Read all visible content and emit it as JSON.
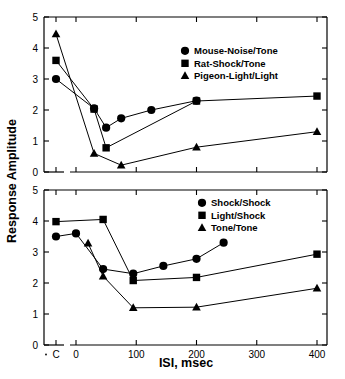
{
  "figure": {
    "axis_titles": {
      "y": "Response Amplitude",
      "x": "ISI, msec"
    }
  },
  "chart_data": [
    {
      "type": "line",
      "panel": "top",
      "title": "",
      "xlabel": "ISI, msec",
      "ylabel": "Response Amplitude",
      "xlim": [
        -1,
        430
      ],
      "ylim": [
        0,
        5
      ],
      "x_break": true,
      "xticks": [
        "C",
        "0",
        "100",
        "200",
        "300",
        "400"
      ],
      "xtick_values": [
        -1,
        0,
        100,
        200,
        300,
        400
      ],
      "yticks": [
        "0",
        "1",
        "2",
        "3",
        "4",
        "5"
      ],
      "ytick_values": [
        0,
        1,
        2,
        3,
        4,
        5
      ],
      "grid": false,
      "legend_position": "upper right",
      "series": [
        {
          "name": "Mouse-Noise/Tone",
          "marker": "circle",
          "x": [
            -1,
            30,
            50,
            75,
            125,
            200
          ],
          "y": [
            3.0,
            2.05,
            1.43,
            1.73,
            2.0,
            2.3
          ]
        },
        {
          "name": "Rat-Shock/Tone",
          "marker": "square",
          "x": [
            -1,
            30,
            50,
            200,
            400
          ],
          "y": [
            3.6,
            2.03,
            0.78,
            2.29,
            2.45
          ]
        },
        {
          "name": "Pigeon-Light/Light",
          "marker": "triangle",
          "x": [
            -1,
            30,
            75,
            200,
            400
          ],
          "y": [
            4.45,
            0.6,
            0.22,
            0.8,
            1.3
          ]
        }
      ]
    },
    {
      "type": "line",
      "panel": "bottom",
      "title": "",
      "xlabel": "ISI, msec",
      "ylabel": "Response Amplitude",
      "xlim": [
        -1,
        430
      ],
      "ylim": [
        0,
        5
      ],
      "x_break": true,
      "xticks": [
        "C",
        "0",
        "100",
        "200",
        "300",
        "400"
      ],
      "xtick_values": [
        -1,
        0,
        100,
        200,
        300,
        400
      ],
      "yticks": [
        "0",
        "1",
        "2",
        "3",
        "4",
        "5"
      ],
      "ytick_values": [
        0,
        1,
        2,
        3,
        4,
        5
      ],
      "grid": false,
      "legend_position": "upper right",
      "series": [
        {
          "name": "Shock/Shock",
          "marker": "circle",
          "x": [
            -1,
            0,
            45,
            95,
            145,
            200,
            245
          ],
          "y": [
            3.5,
            3.6,
            2.45,
            2.3,
            2.55,
            2.78,
            3.3
          ]
        },
        {
          "name": "Light/Shock",
          "marker": "square",
          "x": [
            -1,
            45,
            95,
            200,
            400
          ],
          "y": [
            3.98,
            4.05,
            2.08,
            2.18,
            2.93
          ]
        },
        {
          "name": "Tone/Tone",
          "marker": "triangle",
          "x": [
            20,
            45,
            95,
            200,
            400
          ],
          "y": [
            3.28,
            2.22,
            1.2,
            1.22,
            1.83
          ]
        }
      ]
    }
  ],
  "legends": {
    "top": [
      {
        "marker": "circle",
        "label": "Mouse-Noise/Tone"
      },
      {
        "marker": "square",
        "label": "Rat-Shock/Tone"
      },
      {
        "marker": "triangle",
        "label": "Pigeon-Light/Light"
      }
    ],
    "bottom": [
      {
        "marker": "circle",
        "label": "Shock/Shock"
      },
      {
        "marker": "square",
        "label": "Light/Shock"
      },
      {
        "marker": "triangle",
        "label": "Tone/Tone"
      }
    ]
  },
  "colors": {
    "line": "#000000",
    "marker": "#000000",
    "axis": "#000000",
    "background": "#ffffff"
  }
}
